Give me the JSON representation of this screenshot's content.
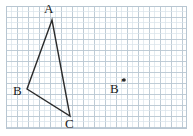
{
  "figure": {
    "canvas": {
      "width": 193,
      "height": 136,
      "background": "#ffffff"
    },
    "grid": {
      "x0": 6,
      "y0": 6,
      "x1": 186,
      "y1": 128,
      "minor_step": 5.5,
      "major_step": 11,
      "minor_color": "#d8e2ea",
      "major_color": "#b8c6d2",
      "border_color": "#b8c6d2",
      "show_grid": true
    },
    "stroke": {
      "color": "#2b2b2b",
      "width": 1.4
    },
    "triangle": {
      "name": "triangle-abc",
      "closed": true,
      "vertices": [
        {
          "id": "A",
          "label": "A",
          "x": 52,
          "y": 20,
          "label_x": 44,
          "label_y": 2
        },
        {
          "id": "B",
          "label": "B",
          "x": 27,
          "y": 89,
          "label_x": 13,
          "label_y": 84
        },
        {
          "id": "C",
          "label": "C",
          "x": 70,
          "y": 116,
          "label_x": 65,
          "label_y": 117
        }
      ]
    },
    "points": [
      {
        "id": "Bprime",
        "label": "B",
        "prime": "′",
        "x": 124,
        "y": 80,
        "dot_radius": 1.8,
        "label_x": 110,
        "label_y": 82,
        "prime_x": 121,
        "prime_y": 76
      }
    ]
  }
}
